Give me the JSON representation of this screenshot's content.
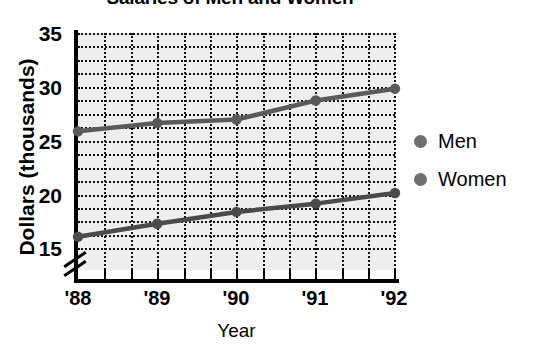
{
  "chart_data": {
    "type": "line",
    "title": "Salaries of Men and Women",
    "xlabel": "Year",
    "ylabel": "Dollars (thousands)",
    "categories": [
      "'88",
      "'89",
      "'90",
      "'91",
      "'92"
    ],
    "series": [
      {
        "name": "Men",
        "values": [
          26.7,
          27.4,
          27.7,
          29.3,
          30.3
        ],
        "color": "#5a5a5a"
      },
      {
        "name": "Women",
        "values": [
          17.8,
          18.9,
          19.9,
          20.6,
          21.5
        ],
        "color": "#4a4a4a"
      }
    ],
    "ylim": [
      15,
      35
    ],
    "yticks": [
      15,
      20,
      25,
      30,
      35
    ],
    "ytick_labels": [
      "15",
      "20",
      "25",
      "30",
      "35"
    ],
    "y_minor_step": 1.25,
    "x_minor_count": 2,
    "axis_break": true,
    "grid": true,
    "grid_style": "dotted",
    "legend_position": "right",
    "plot_background": "#eeeeee",
    "marker": "circle"
  },
  "legend": {
    "items": [
      {
        "label": "Men",
        "marker": "dot-marker"
      },
      {
        "label": "Women",
        "marker": "dot-marker"
      }
    ]
  }
}
